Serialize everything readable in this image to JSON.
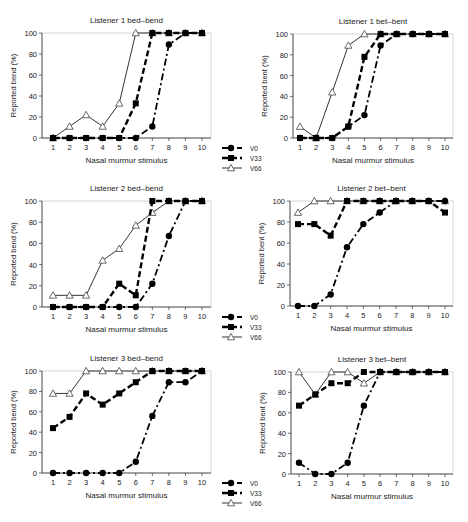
{
  "figure": {
    "x_label": "Nasal murmur stimulus",
    "legend": [
      {
        "key": "V0",
        "label": "V0",
        "marker": "circle",
        "dash": "dashdot"
      },
      {
        "key": "V33",
        "label": "V33",
        "marker": "square",
        "dash": "dash"
      },
      {
        "key": "V66",
        "label": "V66",
        "marker": "triangle",
        "dash": "solid"
      }
    ]
  },
  "chart_data": [
    {
      "type": "line",
      "title": "Listener 1 bed–bend",
      "xlabel": "Nasal murmur stimulus",
      "ylabel": "Reported bend (%)",
      "x": [
        1,
        2,
        3,
        4,
        5,
        6,
        7,
        8,
        9,
        10
      ],
      "ylim": [
        0,
        100
      ],
      "yticks": [
        0,
        20,
        40,
        60,
        80,
        100
      ],
      "series": [
        {
          "name": "V0",
          "values": [
            0,
            0,
            0,
            0,
            0,
            0,
            11,
            89,
            100,
            100
          ]
        },
        {
          "name": "V33",
          "values": [
            0,
            0,
            0,
            0,
            0,
            33,
            100,
            100,
            100,
            100
          ]
        },
        {
          "name": "V66",
          "values": [
            0,
            11,
            22,
            11,
            33,
            100,
            100,
            100,
            100,
            100
          ]
        }
      ],
      "legend_position": "bottom-right",
      "box": {
        "x0": 42,
        "x1": 211,
        "ytop": 33,
        "ybot": 138,
        "tick1": 53,
        "tick10": 202
      }
    },
    {
      "type": "line",
      "title": "Listener 1 bet–bent",
      "xlabel": "Nasal murmur stimulus",
      "ylabel": "Reported bent (%)",
      "x": [
        1,
        2,
        3,
        4,
        5,
        6,
        7,
        8,
        9,
        10
      ],
      "ylim": [
        0,
        100
      ],
      "yticks": [
        0,
        20,
        40,
        60,
        80,
        100
      ],
      "series": [
        {
          "name": "V0",
          "values": [
            0,
            0,
            0,
            11,
            22,
            89,
            100,
            100,
            100,
            100
          ]
        },
        {
          "name": "V33",
          "values": [
            0,
            0,
            0,
            11,
            78,
            100,
            100,
            100,
            100,
            100
          ]
        },
        {
          "name": "V66",
          "values": [
            11,
            0,
            44,
            89,
            100,
            100,
            100,
            100,
            100,
            100
          ]
        }
      ],
      "legend_position": "none",
      "box": {
        "x0": 293,
        "x1": 453,
        "ytop": 34,
        "ybot": 138,
        "tick1": 300,
        "tick10": 445
      }
    },
    {
      "type": "line",
      "title": "Listener 2 bed–bend",
      "xlabel": "Nasal murmur stimulus",
      "ylabel": "Reported bend (%)",
      "x": [
        1,
        2,
        3,
        4,
        5,
        6,
        7,
        8,
        9,
        10
      ],
      "ylim": [
        0,
        100
      ],
      "yticks": [
        0,
        20,
        40,
        60,
        80,
        100
      ],
      "series": [
        {
          "name": "V0",
          "values": [
            0,
            0,
            0,
            0,
            0,
            0,
            22,
            67,
            100,
            100
          ]
        },
        {
          "name": "V33",
          "values": [
            0,
            0,
            0,
            0,
            22,
            11,
            100,
            100,
            100,
            100
          ]
        },
        {
          "name": "V66",
          "values": [
            11,
            11,
            11,
            44,
            55,
            77,
            89,
            100,
            100,
            100
          ]
        }
      ],
      "legend_position": "bottom-right",
      "box": {
        "x0": 42,
        "x1": 211,
        "ytop": 201,
        "ybot": 307,
        "tick1": 53,
        "tick10": 202
      }
    },
    {
      "type": "line",
      "title": "Listener 2 bet–bent",
      "xlabel": "Nasal murmur stimulus",
      "ylabel": "Reported bent (%)",
      "x": [
        1,
        2,
        3,
        4,
        5,
        6,
        7,
        8,
        9,
        10
      ],
      "ylim": [
        0,
        100
      ],
      "yticks": [
        0,
        20,
        40,
        60,
        80,
        100
      ],
      "series": [
        {
          "name": "V0",
          "values": [
            0,
            0,
            11,
            56,
            78,
            89,
            100,
            100,
            100,
            100
          ]
        },
        {
          "name": "V33",
          "values": [
            78,
            78,
            67,
            100,
            100,
            100,
            100,
            100,
            100,
            89
          ]
        },
        {
          "name": "V66",
          "values": [
            89,
            100,
            100,
            100,
            100,
            100,
            100,
            100,
            100,
            100
          ]
        }
      ],
      "legend_position": "none",
      "box": {
        "x0": 290,
        "x1": 453,
        "ytop": 201,
        "ybot": 306,
        "tick1": 298,
        "tick10": 445
      }
    },
    {
      "type": "line",
      "title": "Listener 3 bed–bend",
      "xlabel": "Nasal murmur stimulus",
      "ylabel": "Reported bend (%)",
      "x": [
        1,
        2,
        3,
        4,
        5,
        6,
        7,
        8,
        9,
        10
      ],
      "ylim": [
        0,
        100
      ],
      "yticks": [
        0,
        20,
        40,
        60,
        80,
        100
      ],
      "series": [
        {
          "name": "V0",
          "values": [
            0,
            0,
            0,
            0,
            0,
            11,
            56,
            89,
            89,
            100
          ]
        },
        {
          "name": "V33",
          "values": [
            44,
            55,
            78,
            67,
            78,
            89,
            100,
            100,
            100,
            100
          ]
        },
        {
          "name": "V66",
          "values": [
            78,
            78,
            100,
            100,
            100,
            100,
            100,
            100,
            100,
            100
          ]
        }
      ],
      "legend_position": "bottom-right",
      "box": {
        "x0": 42,
        "x1": 211,
        "ytop": 371,
        "ybot": 473,
        "tick1": 53,
        "tick10": 202
      }
    },
    {
      "type": "line",
      "title": "Listener 3 bet–bent",
      "xlabel": "Nasal murmur stimulus",
      "ylabel": "Reported bent (%)",
      "x": [
        1,
        2,
        3,
        4,
        5,
        6,
        7,
        8,
        9,
        10
      ],
      "ylim": [
        0,
        100
      ],
      "yticks": [
        0,
        20,
        40,
        60,
        80,
        100
      ],
      "series": [
        {
          "name": "V0",
          "values": [
            11,
            0,
            0,
            11,
            67,
            100,
            100,
            100,
            100,
            100
          ]
        },
        {
          "name": "V33",
          "values": [
            67,
            78,
            89,
            89,
            100,
            100,
            100,
            100,
            100,
            100
          ]
        },
        {
          "name": "V66",
          "values": [
            100,
            78,
            100,
            100,
            89,
            100,
            100,
            100,
            100,
            100
          ]
        }
      ],
      "legend_position": "none",
      "box": {
        "x0": 291,
        "x1": 453,
        "ytop": 372,
        "ybot": 474,
        "tick1": 299,
        "tick10": 445
      }
    }
  ]
}
